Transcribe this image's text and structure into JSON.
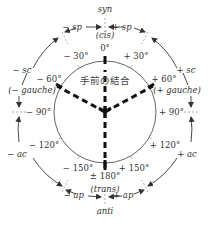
{
  "diagram": {
    "center_label": "手前の結合",
    "regions": {
      "top": "syn",
      "top_sub": "(cis)",
      "bottom": "anti",
      "bottom_sub": "(trans)",
      "upper_left_sp": "− sp",
      "upper_right_sp": "+ sp",
      "left_sc": "− sc",
      "right_sc": "+ sc",
      "left_gauche": "(− gauche)",
      "right_gauche": "(+ gauche)",
      "left_ac": "− ac",
      "right_ac": "+ ac",
      "lower_left_ap": "− ap",
      "lower_right_ap": "+ ap"
    },
    "angles": {
      "a0": "0°",
      "am30": "− 30°",
      "ap30": "+ 30°",
      "am60": "− 60°",
      "ap60": "+ 60°",
      "am90": "− 90°",
      "ap90": "+ 90°",
      "am120": "− 120°",
      "ap120": "+ 120°",
      "am150": "− 150°",
      "ap150": "+ 150°",
      "a180": "± 180°"
    },
    "colors": {
      "bond": "#111111",
      "circle": "#555555",
      "text": "#333333"
    }
  }
}
